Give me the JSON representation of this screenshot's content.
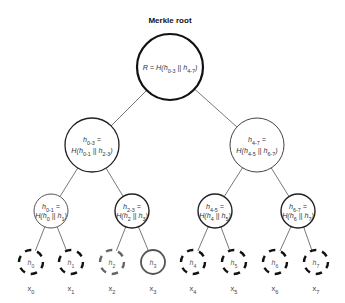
{
  "title": "Merkle root",
  "root": {
    "id": "root",
    "label_lines": [
      "R = H(h0-3 || h4-7)"
    ],
    "label_parts": [
      {
        "t": "R = H(h"
      },
      {
        "sub": "0-3"
      },
      {
        "t": " || h"
      },
      {
        "sub": "4-7"
      },
      {
        "t": ")"
      }
    ],
    "cx": 170,
    "cy": 67,
    "r": 33,
    "stroke": "#111111",
    "stroke_width": 2.2
  },
  "level1": [
    {
      "id": "h0-3",
      "label_lines": [
        "h0-3 =",
        "H(h0-1 || h2-3)"
      ],
      "cx": 92,
      "cy": 145,
      "r": 27,
      "stroke": "#222222",
      "stroke_width": 1.3
    },
    {
      "id": "h4-7",
      "label_lines": [
        "h4-7 =",
        "H(h4-5 || h6-7)"
      ],
      "cx": 257,
      "cy": 145,
      "r": 27,
      "stroke": "#444444",
      "stroke_width": 1.0
    }
  ],
  "level2": [
    {
      "id": "h0-1",
      "label_lines": [
        "h0-1 =",
        "H(h0 || h1)"
      ],
      "cx": 51,
      "cy": 211,
      "r": 17,
      "stroke": "#555555",
      "stroke_width": 1.0
    },
    {
      "id": "h2-3",
      "label_lines": [
        "h2-3 =",
        "H(h2 || h3)"
      ],
      "cx": 132,
      "cy": 211,
      "r": 17,
      "stroke": "#222222",
      "stroke_width": 1.4
    },
    {
      "id": "h4-5",
      "label_lines": [
        "h4-5 =",
        "H(h4 || h5)"
      ],
      "cx": 215,
      "cy": 211,
      "r": 17,
      "stroke": "#222222",
      "stroke_width": 1.4
    },
    {
      "id": "h6-7",
      "label_lines": [
        "h6-7 =",
        "H(h6 || h7)"
      ],
      "cx": 298,
      "cy": 211,
      "r": 17,
      "stroke": "#222222",
      "stroke_width": 1.4
    }
  ],
  "leaves": [
    {
      "id": "h0",
      "label": "h0",
      "x_label": "x0",
      "cx": 31,
      "cy": 262,
      "style": "dashed",
      "stroke": "#111111"
    },
    {
      "id": "h1",
      "label": "h1",
      "x_label": "x1",
      "cx": 71,
      "cy": 262,
      "style": "dashed",
      "stroke": "#111111"
    },
    {
      "id": "h2",
      "label": "h2",
      "x_label": "x2",
      "cx": 112,
      "cy": 262,
      "style": "dashed",
      "stroke": "#666666"
    },
    {
      "id": "h3",
      "label": "h3",
      "x_label": "x3",
      "cx": 153,
      "cy": 262,
      "style": "solid",
      "stroke": "#555555"
    },
    {
      "id": "h4",
      "label": "h4",
      "x_label": "x4",
      "cx": 193,
      "cy": 262,
      "style": "dashed",
      "stroke": "#111111"
    },
    {
      "id": "h5",
      "label": "h5",
      "x_label": "x5",
      "cx": 234,
      "cy": 262,
      "style": "dashed",
      "stroke": "#111111"
    },
    {
      "id": "h6",
      "label": "h6",
      "x_label": "x6",
      "cx": 275,
      "cy": 262,
      "style": "dashed",
      "stroke": "#111111"
    },
    {
      "id": "h7",
      "label": "h7",
      "x_label": "x7",
      "cx": 316,
      "cy": 262,
      "style": "dashed",
      "stroke": "#111111"
    }
  ],
  "leaf_radius": 12,
  "edges": [
    [
      "root",
      "h0-3"
    ],
    [
      "root",
      "h4-7"
    ],
    [
      "h0-3",
      "h0-1"
    ],
    [
      "h0-3",
      "h2-3"
    ],
    [
      "h4-7",
      "h4-5"
    ],
    [
      "h4-7",
      "h6-7"
    ],
    [
      "h0-1",
      "h0"
    ],
    [
      "h0-1",
      "h1"
    ],
    [
      "h2-3",
      "h2"
    ],
    [
      "h2-3",
      "h3"
    ],
    [
      "h4-5",
      "h4"
    ],
    [
      "h4-5",
      "h5"
    ],
    [
      "h6-7",
      "h6"
    ],
    [
      "h6-7",
      "h7"
    ]
  ]
}
